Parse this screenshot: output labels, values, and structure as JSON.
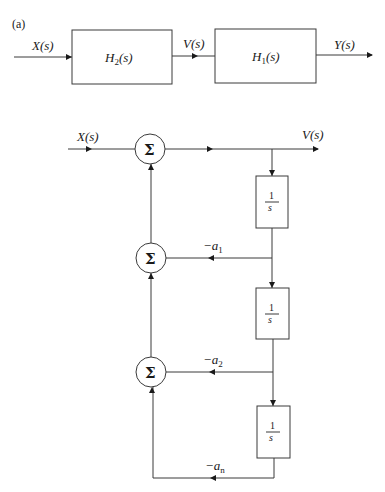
{
  "panel_label": "(a)",
  "top_diagram": {
    "input_label": "X(s)",
    "block_h2": {
      "name": "H",
      "sub": "2",
      "arg": "(s)"
    },
    "intermediate_label": "V(s)",
    "block_h1": {
      "name": "H",
      "sub": "1",
      "arg": "(s)"
    },
    "output_label": "Y(s)"
  },
  "bottom_diagram": {
    "input_label": "X(s)",
    "output_label": "V(s)",
    "summer_symbol": "Σ",
    "summers": [
      {
        "id": "sum-1",
        "symbol": "Σ"
      },
      {
        "id": "sum-2",
        "symbol": "Σ"
      },
      {
        "id": "sum-3",
        "symbol": "Σ"
      }
    ],
    "integrators": [
      {
        "num": "1",
        "den": "s"
      },
      {
        "num": "1",
        "den": "s"
      },
      {
        "num": "1",
        "den": "s"
      }
    ],
    "gains": [
      {
        "sign": "−",
        "var": "a",
        "sub": "1"
      },
      {
        "sign": "−",
        "var": "a",
        "sub": "2"
      },
      {
        "sign": "−",
        "var": "a",
        "sub": "n"
      }
    ]
  },
  "colors": {
    "line": "#3a3a3a",
    "text": "#1a1a1a",
    "background": "#ffffff"
  }
}
